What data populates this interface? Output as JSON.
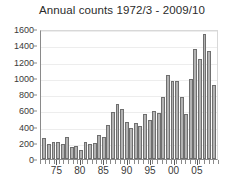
{
  "chart_data": {
    "type": "bar",
    "title": "Annual counts 1972/3 - 2009/10",
    "xlabel": "",
    "ylabel": "",
    "ylim": [
      0,
      1600
    ],
    "ytick_values": [
      0,
      200,
      400,
      600,
      800,
      1000,
      1200,
      1400,
      1600
    ],
    "ytick_labels": [
      "0",
      "200",
      "400",
      "600",
      "800",
      "1000",
      "1200",
      "1400",
      "1600"
    ],
    "grid": true,
    "legend": "none",
    "bar_color": "#b3b3b3",
    "bar_edge_color": "#6f6f6f",
    "categories": [
      "1972/3",
      "1973/4",
      "1974/5",
      "1975/6",
      "1976/7",
      "1977/8",
      "1978/9",
      "1979/80",
      "1980/1",
      "1981/2",
      "1982/3",
      "1983/4",
      "1984/5",
      "1985/6",
      "1986/7",
      "1987/8",
      "1988/9",
      "1989/90",
      "1990/1",
      "1991/2",
      "1992/3",
      "1993/4",
      "1994/5",
      "1995/6",
      "1996/7",
      "1997/8",
      "1998/9",
      "1999/00",
      "2000/1",
      "2001/2",
      "2002/3",
      "2003/4",
      "2004/5",
      "2005/6",
      "2006/7",
      "2007/8",
      "2008/9",
      "2009/10"
    ],
    "values": [
      260,
      185,
      215,
      205,
      180,
      270,
      150,
      155,
      105,
      205,
      185,
      200,
      290,
      265,
      415,
      580,
      680,
      620,
      460,
      385,
      440,
      405,
      555,
      480,
      590,
      565,
      765,
      1040,
      955,
      955,
      760,
      550,
      985,
      1350,
      1235,
      1540,
      1325,
      915
    ],
    "xtick_positions": [
      1975,
      1980,
      1985,
      1990,
      1995,
      2000,
      2005
    ],
    "xtick_labels": [
      "75",
      "80",
      "85",
      "90",
      "95",
      "00",
      "05"
    ],
    "x_start_year": 1972,
    "x_end_year": 2009
  }
}
